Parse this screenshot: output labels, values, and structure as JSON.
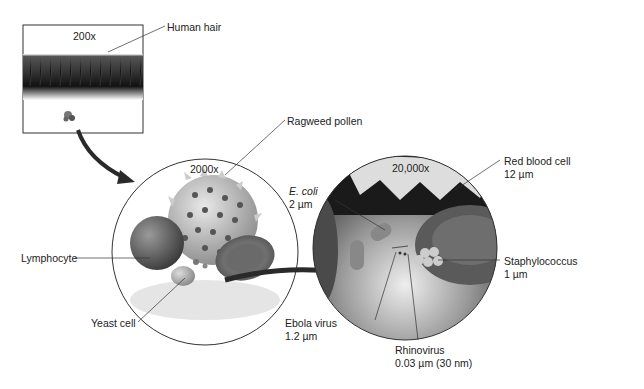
{
  "panels": [
    {
      "id": "hair-box",
      "magnification": "200x"
    },
    {
      "id": "circle-2000",
      "magnification": "2000x"
    },
    {
      "id": "circle-20000",
      "magnification": "20,000x"
    }
  ],
  "labels": {
    "human_hair": "Human hair",
    "ragweed_pollen": "Ragweed pollen",
    "lymphocyte": "Lymphocyte",
    "yeast_cell": "Yeast cell",
    "ecoli_name": "E. coli",
    "ecoli_size": "2 µm",
    "red_blood_cell_name": "Red blood cell",
    "red_blood_cell_size": "12 µm",
    "staphylococcus_name": "Staphylococcus",
    "staphylococcus_size": "1 µm",
    "ebola_name": "Ebola virus",
    "ebola_size": "1.2 µm",
    "rhinovirus_name": "Rhinovirus",
    "rhinovirus_size": "0.03 µm (30 nm)"
  },
  "colors": {
    "line": "#333333",
    "hair_dark": "#2a2a2a",
    "cell_gray": "#7a7a7a"
  }
}
